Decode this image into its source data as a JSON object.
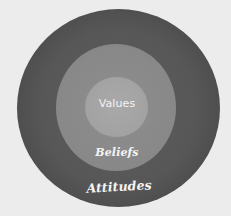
{
  "diagram": {
    "type": "concentric-circles",
    "background_color": "#ececec",
    "layers": [
      {
        "id": "outer",
        "label": "Attitudes",
        "color": "#505050"
      },
      {
        "id": "middle",
        "label": "Beliefs",
        "color": "#888888"
      },
      {
        "id": "inner",
        "label": "Values",
        "color": "#a5a5a5"
      }
    ],
    "text_color": "#f4f4f4"
  }
}
